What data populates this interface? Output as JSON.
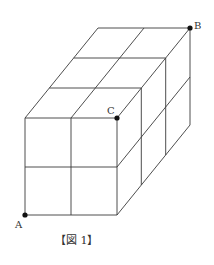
{
  "figure": {
    "caption": "【図 1】",
    "points": {
      "A": {
        "label": "A"
      },
      "B": {
        "label": "B"
      },
      "C": {
        "label": "C"
      }
    },
    "line_color": "#3a3a3a",
    "point_color": "#111111"
  }
}
